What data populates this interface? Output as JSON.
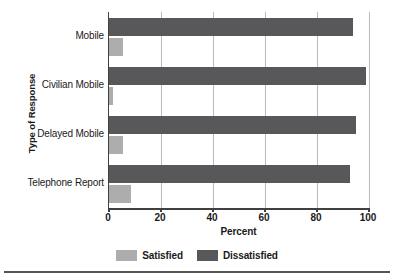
{
  "chart_data": {
    "type": "bar",
    "orientation": "horizontal",
    "title": "",
    "xlabel": "Percent",
    "ylabel": "Type of Response",
    "xlim": [
      0,
      100
    ],
    "xticks": [
      0,
      20,
      40,
      60,
      80,
      100
    ],
    "grid": true,
    "legend_position": "bottom",
    "categories": [
      "Mobile",
      "Civilian Mobile",
      "Delayed Mobile",
      "Telephone Report"
    ],
    "series": [
      {
        "name": "Satisfied",
        "color": "#adadad",
        "values": [
          5.5,
          1.5,
          5.5,
          8.5
        ]
      },
      {
        "name": "Dissatisfied",
        "color": "#58585a",
        "values": [
          94.0,
          99.0,
          95.0,
          92.5
        ]
      }
    ]
  },
  "axes": {
    "y_title": "Type of Response",
    "x_title": "Percent",
    "x_tick_labels": [
      "0",
      "20",
      "40",
      "60",
      "80",
      "100"
    ]
  },
  "legend": {
    "items": [
      {
        "label": "Satisfied",
        "color": "#adadad"
      },
      {
        "label": "Dissatisfied",
        "color": "#58585a"
      }
    ]
  },
  "colors": {
    "satisfied": "#adadad",
    "dissatisfied": "#58585a",
    "axis": "#404040",
    "gridline": "#b9b9b9",
    "background": "#ffffff"
  }
}
